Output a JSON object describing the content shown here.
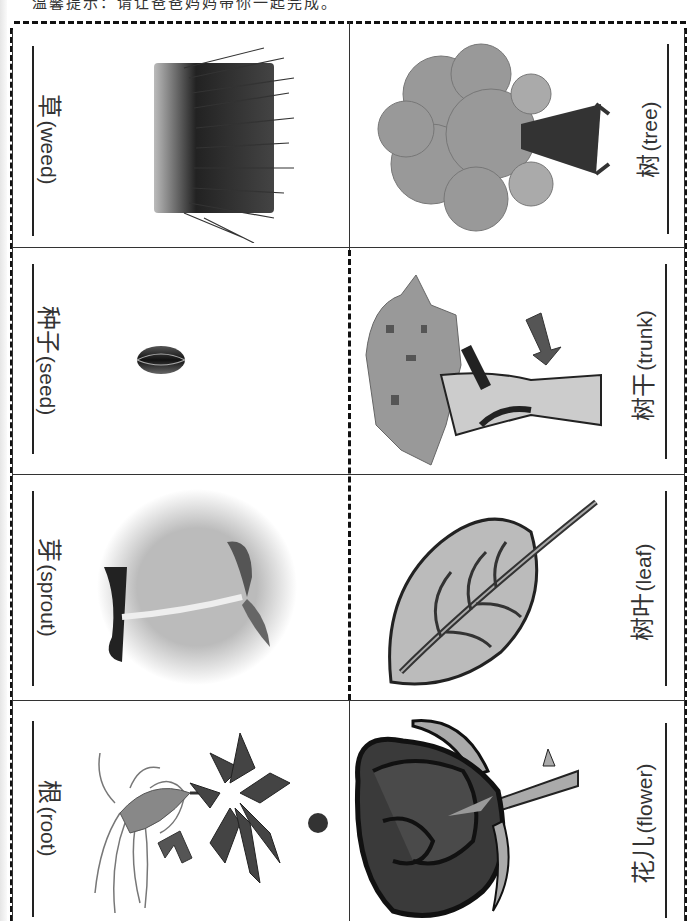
{
  "header": {
    "notice": "温馨提示：请让爸爸妈妈带你一起完成。"
  },
  "cards": {
    "left": [
      {
        "zh": "草",
        "en": "(weed)",
        "picture": "weed-grass-picture"
      },
      {
        "zh": "种子",
        "en": "(seed)",
        "picture": "seed-picture"
      },
      {
        "zh": "芽",
        "en": "(sprout)",
        "picture": "sprout-picture"
      },
      {
        "zh": "根",
        "en": "(root)",
        "picture": "root-picture"
      }
    ],
    "right": [
      {
        "zh": "树",
        "en": "(tree)",
        "picture": "tree-picture"
      },
      {
        "zh": "树干",
        "en": "(trunk)",
        "picture": "trunk-picture"
      },
      {
        "zh": "树叶",
        "en": "(leaf)",
        "picture": "leaf-picture"
      },
      {
        "zh": "花儿",
        "en": "(flower)",
        "picture": "flower-picture"
      }
    ]
  },
  "colors": {
    "line": "#111111",
    "frame": "#333333",
    "arrow": "#555555"
  }
}
